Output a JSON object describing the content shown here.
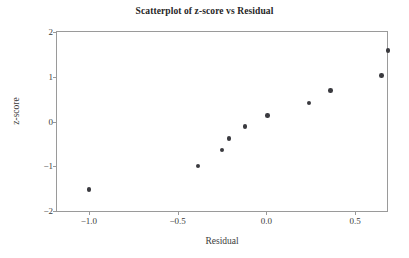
{
  "chart_data": {
    "type": "scatter",
    "title": "Scatterplot of z-score vs Residual",
    "xlabel": "Residual",
    "ylabel": "z-score",
    "xlim": [
      -1.18,
      0.68
    ],
    "ylim": [
      -2,
      2
    ],
    "grid": false,
    "legend": null,
    "marker": {
      "shape": "circle",
      "color": "#3a3a3f",
      "size_px": 4.6
    },
    "axes": {
      "frame_color": "#9a9a9a",
      "background": "#ffffff",
      "xticks": [
        -1.0,
        -0.5,
        0.0,
        0.5
      ],
      "xtick_labels": [
        "-1.0",
        "-0.5",
        "0.0",
        "0.5"
      ],
      "yticks": [
        2,
        1,
        0,
        -1,
        -2
      ],
      "ytick_labels": [
        "2",
        "1",
        "0",
        "-1",
        "-2"
      ]
    },
    "series": [
      {
        "name": "z-score vs Residual",
        "x": [
          -1.0,
          -0.385,
          -0.25,
          -0.21,
          -0.12,
          0.005,
          0.24,
          0.36,
          0.65,
          0.685
        ],
        "y": [
          -1.52,
          -0.99,
          -0.64,
          -0.38,
          -0.11,
          0.13,
          0.41,
          0.69,
          1.03,
          1.58
        ]
      }
    ]
  },
  "figure": {
    "title": "Scatterplot of z-score vs Residual",
    "x_axis_title": "Residual",
    "y_axis_title": "z-score"
  }
}
